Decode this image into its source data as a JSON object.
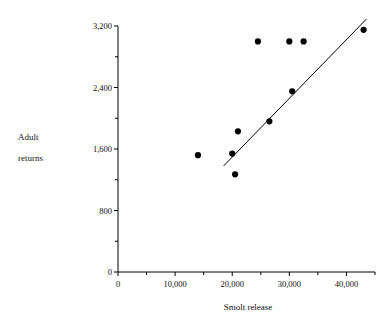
{
  "chart_data": {
    "type": "scatter",
    "title": "",
    "xlabel": "Smolt release",
    "ylabel": "Adult returns",
    "xlim": [
      0,
      45000
    ],
    "ylim": [
      0,
      3200
    ],
    "grid": false,
    "legend": null,
    "x_tick_labels": [
      "0",
      "10,000",
      "20,000",
      "30,000",
      "40,000"
    ],
    "x_tick_values": [
      0,
      10000,
      20000,
      30000,
      40000
    ],
    "x_minor_tick_values": [
      5000,
      15000,
      25000,
      35000,
      45000
    ],
    "y_tick_labels": [
      "0",
      "800",
      "1,600",
      "2,400",
      "3,200"
    ],
    "y_tick_values": [
      0,
      800,
      1600,
      2400,
      3200
    ],
    "y_minor_tick_values": [
      400,
      1200,
      2000,
      2800
    ],
    "x": [
      14000,
      20000,
      20500,
      21000,
      24500,
      26500,
      30000,
      30500,
      32500,
      43000
    ],
    "y": [
      1520,
      1540,
      1270,
      1830,
      3000,
      1960,
      3000,
      2350,
      3000,
      3150
    ],
    "points": [
      {
        "x": 14000,
        "y": 1520
      },
      {
        "x": 20000,
        "y": 1540
      },
      {
        "x": 20500,
        "y": 1270
      },
      {
        "x": 21000,
        "y": 1830
      },
      {
        "x": 24500,
        "y": 3000
      },
      {
        "x": 26500,
        "y": 1960
      },
      {
        "x": 30000,
        "y": 3000
      },
      {
        "x": 30500,
        "y": 2350
      },
      {
        "x": 32500,
        "y": 3000
      },
      {
        "x": 43000,
        "y": 3150
      }
    ],
    "marker": {
      "shape": "circle",
      "color": "#000000",
      "size": 5
    },
    "trendline": {
      "type": "line",
      "x0": 18500,
      "y0": 1380,
      "x1": 43500,
      "y1": 3290,
      "color": "#000000"
    },
    "axis_color": "#000000",
    "background_color": "#ffffff"
  },
  "axis": {
    "x_title": "Smolt release",
    "y_title_line1": "Adult",
    "y_title_line2": "returns"
  }
}
